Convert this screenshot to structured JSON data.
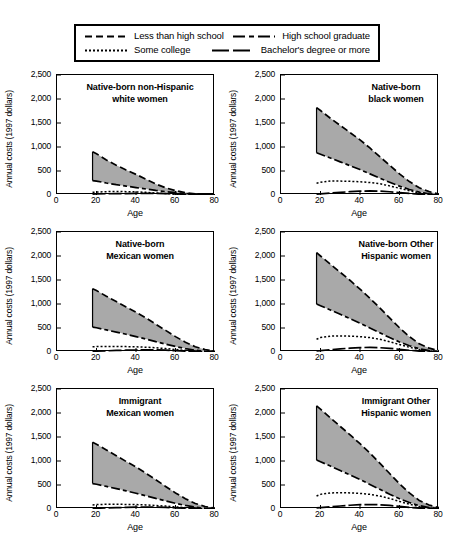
{
  "legend": {
    "entries": [
      {
        "label": "Less than high school",
        "style": "long-dash"
      },
      {
        "label": "High school graduate",
        "style": "dash-dot"
      },
      {
        "label": "Some college",
        "style": "dotted"
      },
      {
        "label": "Bachelor's degree or more",
        "style": "solid-dash"
      }
    ]
  },
  "axes": {
    "ylabel": "Annual costs (1997 dollars)",
    "xlabel": "Age",
    "yticks": [
      "0",
      "500",
      "1,000",
      "1,500",
      "2,000",
      "2,500"
    ],
    "xticks": [
      "0",
      "20",
      "40",
      "60",
      "80"
    ],
    "ylim": [
      0,
      2500
    ],
    "xlim": [
      0,
      80
    ]
  },
  "colors": {
    "fill": "#a9a9a9",
    "line": "#000000",
    "frame": "#000000",
    "background": "#ffffff"
  },
  "chart_data": {
    "type": "area",
    "xlabel": "Age",
    "ylabel": "Annual costs (1997 dollars)",
    "xlim": [
      0,
      80
    ],
    "ylim": [
      0,
      2500
    ],
    "grid": false,
    "legend_position": "top",
    "x": [
      18,
      20,
      25,
      30,
      35,
      40,
      45,
      50,
      55,
      60,
      65,
      70,
      75,
      80
    ],
    "series_names": [
      "Less than high school",
      "High school graduate",
      "Some college",
      "Bachelor's degree or more"
    ],
    "shaded_band": "between Less than high school and High school graduate",
    "panels": [
      {
        "title": "Native-born non-Hispanic\nwhite women",
        "series": [
          {
            "name": "Less than high school",
            "style": "long-dash",
            "values": [
              900,
              860,
              730,
              620,
              520,
              430,
              330,
              230,
              150,
              90,
              50,
              25,
              10,
              5
            ]
          },
          {
            "name": "High school graduate",
            "style": "dash-dot",
            "values": [
              300,
              290,
              250,
              215,
              185,
              155,
              125,
              95,
              70,
              50,
              30,
              15,
              8,
              3
            ]
          },
          {
            "name": "Some college",
            "style": "dotted",
            "values": [
              55,
              60,
              70,
              72,
              70,
              65,
              55,
              42,
              30,
              18,
              10,
              5,
              3,
              1
            ]
          },
          {
            "name": "Bachelor's degree or more",
            "style": "solid-dash",
            "values": [
              20,
              22,
              26,
              28,
              30,
              32,
              35,
              35,
              30,
              22,
              14,
              7,
              3,
              1
            ]
          }
        ]
      },
      {
        "title": "Native-born\nblack women",
        "series": [
          {
            "name": "Less than high school",
            "style": "long-dash",
            "values": [
              1820,
              1760,
              1600,
              1450,
              1300,
              1150,
              980,
              800,
              620,
              440,
              280,
              150,
              70,
              20
            ]
          },
          {
            "name": "High school graduate",
            "style": "dash-dot",
            "values": [
              880,
              850,
              770,
              690,
              610,
              530,
              440,
              350,
              265,
              185,
              115,
              60,
              25,
              8
            ]
          },
          {
            "name": "Some college",
            "style": "dotted",
            "values": [
              245,
              265,
              290,
              290,
              285,
              275,
              260,
              235,
              190,
              140,
              90,
              45,
              18,
              5
            ]
          },
          {
            "name": "Bachelor's degree or more",
            "style": "solid-dash",
            "values": [
              20,
              25,
              40,
              55,
              70,
              80,
              85,
              80,
              68,
              50,
              32,
              16,
              7,
              2
            ]
          }
        ]
      },
      {
        "title": "Native-born\nMexican women",
        "series": [
          {
            "name": "Less than high school",
            "style": "long-dash",
            "values": [
              1320,
              1280,
              1160,
              1050,
              940,
              830,
              710,
              580,
              450,
              320,
              205,
              110,
              50,
              15
            ]
          },
          {
            "name": "High school graduate",
            "style": "dash-dot",
            "values": [
              520,
              505,
              460,
              415,
              370,
              320,
              270,
              215,
              165,
              115,
              72,
              38,
              16,
              5
            ]
          },
          {
            "name": "Some college",
            "style": "dotted",
            "values": [
              110,
              112,
              115,
              115,
              112,
              108,
              100,
              88,
              72,
              52,
              33,
              16,
              6,
              2
            ]
          },
          {
            "name": "Bachelor's degree or more",
            "style": "solid-dash",
            "values": [
              15,
              18,
              25,
              32,
              38,
              42,
              45,
              43,
              37,
              27,
              17,
              9,
              4,
              1
            ]
          }
        ]
      },
      {
        "title": "Native-born Other\nHispanic women",
        "series": [
          {
            "name": "Less than high school",
            "style": "long-dash",
            "values": [
              2070,
              2000,
              1830,
              1660,
              1490,
              1310,
              1120,
              920,
              710,
              505,
              320,
              170,
              80,
              25
            ]
          },
          {
            "name": "High school graduate",
            "style": "dash-dot",
            "values": [
              1000,
              965,
              875,
              785,
              695,
              600,
              500,
              400,
              300,
              210,
              130,
              68,
              28,
              9
            ]
          },
          {
            "name": "Some college",
            "style": "dotted",
            "values": [
              265,
              300,
              330,
              335,
              330,
              320,
              300,
              265,
              215,
              155,
              98,
              50,
              20,
              6
            ]
          },
          {
            "name": "Bachelor's degree or more",
            "style": "solid-dash",
            "values": [
              25,
              30,
              48,
              65,
              80,
              92,
              95,
              90,
              76,
              56,
              36,
              18,
              8,
              2
            ]
          }
        ]
      },
      {
        "title": "Immigrant\nMexican women",
        "series": [
          {
            "name": "Less than high school",
            "style": "long-dash",
            "values": [
              1390,
              1350,
              1230,
              1110,
              990,
              875,
              745,
              610,
              470,
              335,
              215,
              115,
              52,
              16
            ]
          },
          {
            "name": "High school graduate",
            "style": "dash-dot",
            "values": [
              530,
              515,
              470,
              425,
              378,
              328,
              276,
              220,
              168,
              118,
              74,
              39,
              17,
              5
            ]
          },
          {
            "name": "Some college",
            "style": "dotted",
            "values": [
              85,
              92,
              98,
              98,
              96,
              92,
              85,
              74,
              60,
              44,
              28,
              14,
              5,
              2
            ]
          },
          {
            "name": "Bachelor's degree or more",
            "style": "solid-dash",
            "values": [
              12,
              15,
              22,
              28,
              33,
              37,
              39,
              38,
              32,
              24,
              15,
              8,
              3,
              1
            ]
          }
        ]
      },
      {
        "title": "Immigrant Other\nHispanic women",
        "series": [
          {
            "name": "Less than high school",
            "style": "long-dash",
            "values": [
              2150,
              2080,
              1900,
              1720,
              1545,
              1360,
              1165,
              955,
              740,
              525,
              335,
              178,
              83,
              26
            ]
          },
          {
            "name": "High school graduate",
            "style": "dash-dot",
            "values": [
              1020,
              985,
              895,
              800,
              710,
              615,
              512,
              410,
              308,
              215,
              134,
              70,
              29,
              9
            ]
          },
          {
            "name": "Some college",
            "style": "dotted",
            "values": [
              270,
              305,
              335,
              340,
              335,
              325,
              305,
              270,
              220,
              158,
              100,
              51,
              20,
              6
            ]
          },
          {
            "name": "Bachelor's degree or more",
            "style": "solid-dash",
            "values": [
              22,
              28,
              45,
              62,
              78,
              90,
              93,
              88,
              74,
              55,
              35,
              18,
              8,
              2
            ]
          }
        ]
      }
    ]
  }
}
